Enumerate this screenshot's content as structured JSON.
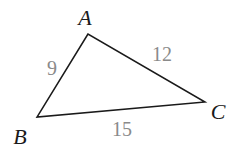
{
  "diagram": {
    "type": "triangle",
    "vertices": [
      {
        "name": "A",
        "x": 88,
        "y": 34,
        "label_x": 85,
        "label_y": 25
      },
      {
        "name": "B",
        "x": 37,
        "y": 117,
        "label_x": 20,
        "label_y": 144
      },
      {
        "name": "C",
        "x": 205,
        "y": 102,
        "label_x": 218,
        "label_y": 119
      }
    ],
    "sides": [
      {
        "name": "AB",
        "length": "9",
        "label_x": 52,
        "label_y": 75
      },
      {
        "name": "AC",
        "length": "12",
        "label_x": 162,
        "label_y": 61
      },
      {
        "name": "BC",
        "length": "15",
        "label_x": 122,
        "label_y": 136
      }
    ],
    "colors": {
      "edge": "#1a1a1a",
      "vertex_label": "#1a1a1a",
      "side_label": "#8a8a8a"
    }
  }
}
